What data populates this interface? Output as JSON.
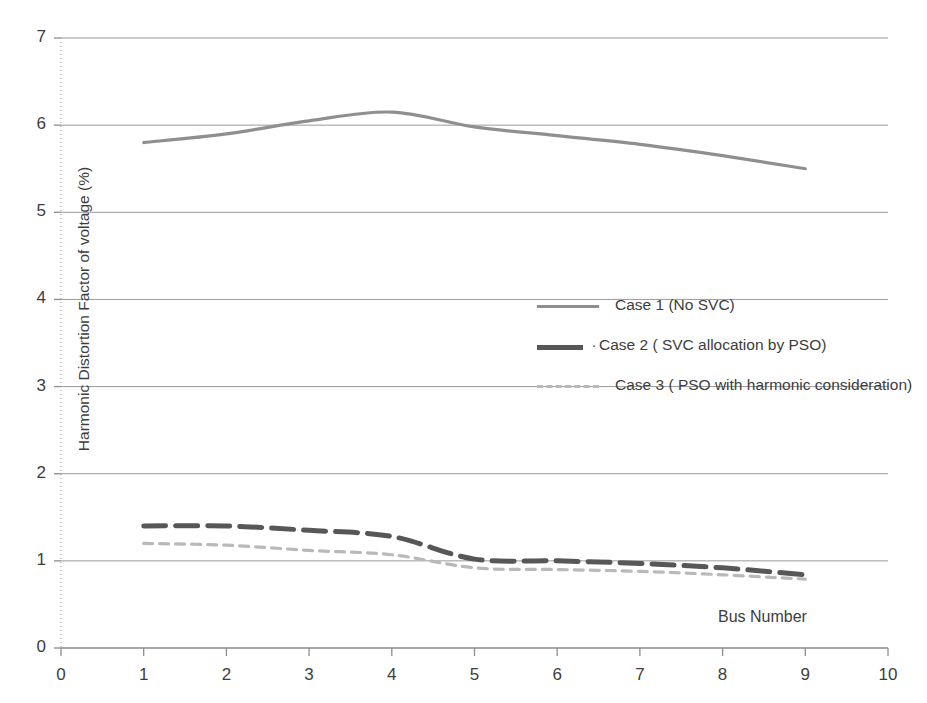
{
  "chart_data": {
    "type": "line",
    "title": "",
    "xlabel": "Bus Number",
    "ylabel": "Harmonic Distortion Factor of voltage (%)",
    "xlim": [
      0,
      10
    ],
    "ylim": [
      0,
      7
    ],
    "x_ticks": [
      "0",
      "1",
      "2",
      "3",
      "4",
      "5",
      "6",
      "7",
      "8",
      "9",
      "10"
    ],
    "y_ticks": [
      "0",
      "1",
      "2",
      "3",
      "4",
      "5",
      "6",
      "7"
    ],
    "grid": "horizontal",
    "legend_position": "center-right-inside",
    "x": [
      1,
      2,
      3,
      4,
      5,
      6,
      7,
      8,
      9
    ],
    "series": [
      {
        "name": "Case 1 (No SVC)",
        "style": "solid",
        "color": "#8f8f8f",
        "width": 3.2,
        "values": [
          5.8,
          5.9,
          6.05,
          6.15,
          5.98,
          5.88,
          5.78,
          5.65,
          5.5
        ]
      },
      {
        "name": "Case 2 ( SVC allocation by PSO)",
        "style": "dashed-heavy",
        "color": "#575757",
        "width": 5,
        "values": [
          1.4,
          1.4,
          1.35,
          1.28,
          1.02,
          1.0,
          0.97,
          0.92,
          0.84
        ]
      },
      {
        "name": "Case 3 ( PSO with harmonic consideration)",
        "style": "dashed-light",
        "color": "#b9b9b9",
        "width": 3.2,
        "values": [
          1.2,
          1.18,
          1.12,
          1.07,
          0.92,
          0.9,
          0.88,
          0.84,
          0.79
        ]
      }
    ]
  },
  "axes": {
    "y_title": "Harmonic Distortion Factor of voltage (%)",
    "x_title": "Bus Number"
  },
  "legend": {
    "items": [
      {
        "label": "Case 1 (No SVC)",
        "marker": "",
        "swatch": "sw-case1"
      },
      {
        "label": "Case 2 ( SVC allocation by PSO)",
        "marker": "·",
        "swatch": "sw-case2"
      },
      {
        "label": "Case 3 ( PSO with harmonic consideration)",
        "marker": "",
        "swatch": "sw-case3"
      }
    ]
  },
  "colors": {
    "case1": "#8f8f8f",
    "case2": "#575757",
    "case3": "#b9b9b9",
    "grid": "#9a9a9a",
    "axis": "#8d8d8d",
    "text": "#3d3d3d"
  }
}
